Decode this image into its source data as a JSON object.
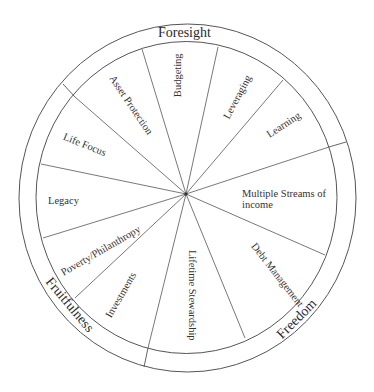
{
  "diagram": {
    "type": "wheel",
    "center": [
      186,
      194
    ],
    "outer_ring_labels": [
      {
        "id": "foresight",
        "label": "Foresight"
      },
      {
        "id": "freedom",
        "label": "Freedom"
      },
      {
        "id": "fruitfulness",
        "label": "Fruitfulness"
      }
    ],
    "segments": [
      {
        "id": "budgeting",
        "label": "Budgeting",
        "group": "Foresight"
      },
      {
        "id": "leveraging",
        "label": "Leveraging",
        "group": "Foresight"
      },
      {
        "id": "learning",
        "label": "Learning",
        "group": "Foresight"
      },
      {
        "id": "multiple-streams",
        "label": "Multiple Streams of income",
        "group": "Freedom"
      },
      {
        "id": "debt-management",
        "label": "Debt Management",
        "group": "Freedom"
      },
      {
        "id": "lifetime-stewardship",
        "label": "Lifetime Stewardship",
        "group": "Freedom"
      },
      {
        "id": "investments",
        "label": "Investments",
        "group": "Fruitfulness"
      },
      {
        "id": "poverty-philanthropy",
        "label": "Poverty/Philanthropy",
        "group": "Fruitfulness"
      },
      {
        "id": "legacy",
        "label": "Legacy",
        "group": "Fruitfulness"
      },
      {
        "id": "life-focus",
        "label": "Life Focus",
        "group": "Fruitfulness"
      },
      {
        "id": "asset-protection",
        "label": "Asset Protection",
        "group": "Foresight"
      }
    ],
    "colors": {
      "line": "#555555",
      "background": "#ffffff",
      "text": "#333333"
    }
  }
}
